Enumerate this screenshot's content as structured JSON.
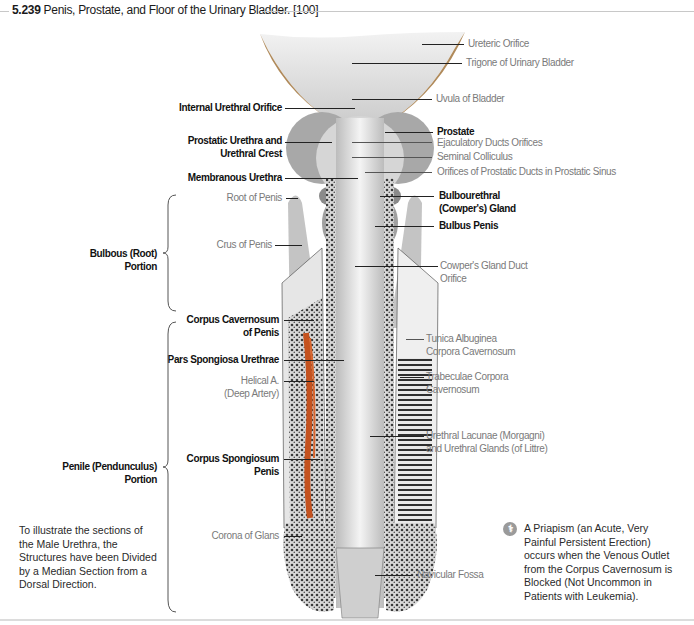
{
  "figure": {
    "number": "5.239",
    "title": "Penis, Prostate, and Floor of the Urinary Bladder. [100]"
  },
  "labels_right": [
    {
      "text": "Ureteric Orifice",
      "style": "light"
    },
    {
      "text": "Trigone of Urinary Bladder",
      "style": "light"
    },
    {
      "text": "Uvula of Bladder",
      "style": "light"
    },
    {
      "text": "Prostate",
      "style": "bold"
    },
    {
      "text": "Ejaculatory Ducts Orifices",
      "style": "light"
    },
    {
      "text": "Seminal Colliculus",
      "style": "light"
    },
    {
      "text": "Orifices of Prostatic Ducts in Prostatic Sinus",
      "style": "light"
    },
    {
      "text": "Bulbourethral",
      "text2": "(Cowper's) Gland",
      "style": "bold"
    },
    {
      "text": "Bulbus Penis",
      "style": "bold"
    },
    {
      "text": "Cowper's Gland Duct",
      "text2": "Orifice",
      "style": "light"
    },
    {
      "text": "Tunica Albuginea",
      "text2": "Corpora Cavernosum",
      "style": "light"
    },
    {
      "text": "Trabeculae Corpora",
      "text2": "Cavernosum",
      "style": "light"
    },
    {
      "text": "Urethral Lacunae (Morgagni)",
      "text2": "and Urethral Glands (of Littre)",
      "style": "light"
    },
    {
      "text": "Navicular Fossa",
      "style": "light"
    }
  ],
  "labels_left": [
    {
      "text": "Internal Urethral Orifice",
      "style": "bold"
    },
    {
      "text": "Prostatic Urethra and",
      "text2": "Urethral Crest",
      "style": "bold"
    },
    {
      "text": "Membranous Urethra",
      "style": "bold"
    },
    {
      "text": "Root of Penis",
      "style": "light"
    },
    {
      "text": "Crus of Penis",
      "style": "light"
    },
    {
      "text": "Corpus Cavernosum",
      "text2": "of Penis",
      "style": "bold"
    },
    {
      "text": "Pars Spongiosa Urethrae",
      "style": "bold"
    },
    {
      "text": "Helical A.",
      "text2": "(Deep Artery)",
      "style": "light"
    },
    {
      "text": "Corpus Spongiosum",
      "text2": "Penis",
      "style": "bold"
    },
    {
      "text": "Corona of Glans",
      "style": "light"
    }
  ],
  "brackets": [
    {
      "text": "Bulbous (Root)",
      "text2": "Portion"
    },
    {
      "text": "Penile (Pendunculus)",
      "text2": "Portion"
    }
  ],
  "notes": {
    "left": "To illustrate the sections of the Male Urethra, the Structures have been Divided by a Median Section from a Dorsal Direction.",
    "right": "A Priapism (an Acute, Very Painful Persistent Erection) occurs when the Venous Outlet from the Corpus Cavernosum is Blocked (Not Uncommon in Patients with Leukemia).",
    "right_icon": "clinical-note-icon"
  },
  "colors": {
    "artery": "#c4521f",
    "bladder_wall": "#b08a5a",
    "tissue_grey": "#bdbdbd"
  }
}
